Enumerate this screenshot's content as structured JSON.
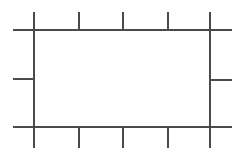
{
  "canvas": {
    "width": 243,
    "height": 155,
    "background_color": "#ffffff",
    "title": "Rectangular frame diagram with tick marks"
  },
  "style": {
    "stroke_color": "#4a4a4a",
    "stroke_width": 2,
    "stroke_linecap": "butt"
  },
  "chart_data": {
    "type": "diagram",
    "frame": {
      "left_x": 34,
      "right_x": 210,
      "top_y": 30,
      "bottom_y": 127
    },
    "extents": {
      "horizontal_line_start_x": 13,
      "horizontal_line_end_x": 232,
      "vertical_line_start_y": 12,
      "vertical_line_end_y": 148
    },
    "segments": [
      {
        "id": "top-rail",
        "name": "top-horizontal-rail",
        "orientation": "horizontal",
        "x1": 13,
        "y1": 30,
        "x2": 232,
        "y2": 30
      },
      {
        "id": "bottom-rail",
        "name": "bottom-horizontal-rail",
        "orientation": "horizontal",
        "x1": 13,
        "y1": 127,
        "x2": 232,
        "y2": 127
      },
      {
        "id": "left-post",
        "name": "left-vertical-post",
        "orientation": "vertical",
        "x1": 34,
        "y1": 12,
        "x2": 34,
        "y2": 148
      },
      {
        "id": "right-post",
        "name": "right-vertical-post",
        "orientation": "vertical",
        "x1": 210,
        "y1": 12,
        "x2": 210,
        "y2": 148
      },
      {
        "id": "top-tick-1",
        "name": "top-tick-mark",
        "orientation": "vertical",
        "x1": 79,
        "y1": 12,
        "x2": 79,
        "y2": 30
      },
      {
        "id": "top-tick-2",
        "name": "top-tick-mark",
        "orientation": "vertical",
        "x1": 123,
        "y1": 12,
        "x2": 123,
        "y2": 30
      },
      {
        "id": "top-tick-3",
        "name": "top-tick-mark",
        "orientation": "vertical",
        "x1": 168,
        "y1": 12,
        "x2": 168,
        "y2": 30
      },
      {
        "id": "bottom-tick-1",
        "name": "bottom-tick-mark",
        "orientation": "vertical",
        "x1": 79,
        "y1": 127,
        "x2": 79,
        "y2": 148
      },
      {
        "id": "bottom-tick-2",
        "name": "bottom-tick-mark",
        "orientation": "vertical",
        "x1": 123,
        "y1": 127,
        "x2": 123,
        "y2": 148
      },
      {
        "id": "bottom-tick-3",
        "name": "bottom-tick-mark",
        "orientation": "vertical",
        "x1": 168,
        "y1": 127,
        "x2": 168,
        "y2": 148
      },
      {
        "id": "left-tick-mid",
        "name": "left-tick-mark",
        "orientation": "horizontal",
        "x1": 13,
        "y1": 79,
        "x2": 34,
        "y2": 79
      },
      {
        "id": "right-tick-mid",
        "name": "right-tick-mark",
        "orientation": "horizontal",
        "x1": 210,
        "y1": 80,
        "x2": 232,
        "y2": 80
      }
    ],
    "counts": {
      "top_ticks": 3,
      "bottom_ticks": 3,
      "left_ticks": 1,
      "right_ticks": 1,
      "total_segments": 13
    }
  }
}
